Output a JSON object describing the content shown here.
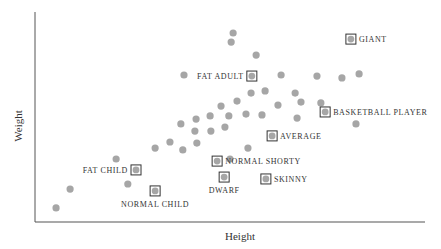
{
  "chart_data": {
    "type": "scatter",
    "title": "",
    "xlabel": "Height",
    "ylabel": "Weight",
    "grid": false,
    "legend": null,
    "xlim": [
      0,
      100
    ],
    "ylim": [
      0,
      100
    ],
    "axis_ticks": "none",
    "marker_color": "#a6a6a6",
    "box_color": "#333333",
    "series": [
      {
        "name": "population",
        "points": [
          {
            "x": 5.4,
            "y": 6.7
          },
          {
            "x": 9.0,
            "y": 15.7
          },
          {
            "x": 20.8,
            "y": 30.0
          },
          {
            "x": 23.8,
            "y": 18.1
          },
          {
            "x": 30.8,
            "y": 35.2
          },
          {
            "x": 34.6,
            "y": 38.1
          },
          {
            "x": 37.4,
            "y": 46.7
          },
          {
            "x": 38.2,
            "y": 70.0
          },
          {
            "x": 37.9,
            "y": 34.3
          },
          {
            "x": 41.3,
            "y": 49.0
          },
          {
            "x": 41.0,
            "y": 43.3
          },
          {
            "x": 41.5,
            "y": 37.6
          },
          {
            "x": 44.9,
            "y": 50.5
          },
          {
            "x": 45.1,
            "y": 43.3
          },
          {
            "x": 47.7,
            "y": 55.2
          },
          {
            "x": 48.7,
            "y": 45.2
          },
          {
            "x": 49.7,
            "y": 50.5
          },
          {
            "x": 50.0,
            "y": 30.0
          },
          {
            "x": 50.8,
            "y": 90.0
          },
          {
            "x": 50.3,
            "y": 85.7
          },
          {
            "x": 51.8,
            "y": 57.6
          },
          {
            "x": 54.1,
            "y": 51.4
          },
          {
            "x": 54.6,
            "y": 35.2
          },
          {
            "x": 55.4,
            "y": 61.4
          },
          {
            "x": 56.7,
            "y": 79.5
          },
          {
            "x": 58.2,
            "y": 51.0
          },
          {
            "x": 59.0,
            "y": 62.4
          },
          {
            "x": 62.3,
            "y": 55.7
          },
          {
            "x": 63.1,
            "y": 70.0
          },
          {
            "x": 66.7,
            "y": 61.4
          },
          {
            "x": 67.2,
            "y": 49.5
          },
          {
            "x": 68.2,
            "y": 57.1
          },
          {
            "x": 72.3,
            "y": 69.5
          },
          {
            "x": 73.3,
            "y": 56.7
          },
          {
            "x": 78.7,
            "y": 68.6
          },
          {
            "x": 82.3,
            "y": 46.7
          },
          {
            "x": 83.1,
            "y": 70.5
          }
        ]
      },
      {
        "name": "labelled",
        "points": [
          {
            "label": "GIANT",
            "x": 81.0,
            "y": 87.1
          },
          {
            "label": "FAT ADULT",
            "x": 55.6,
            "y": 69.5
          },
          {
            "label": "BASKETBALL PLAYER",
            "x": 74.4,
            "y": 52.4
          },
          {
            "label": "AVERAGE",
            "x": 60.8,
            "y": 41.0
          },
          {
            "label": "NORMAL SHORTY",
            "x": 46.7,
            "y": 29.0
          },
          {
            "label": "SKINNY",
            "x": 59.2,
            "y": 20.5
          },
          {
            "label": "FAT CHILD",
            "x": 25.9,
            "y": 24.8
          },
          {
            "label": "DWARF",
            "x": 48.5,
            "y": 21.4
          },
          {
            "label": "NORMAL CHILD",
            "x": 30.8,
            "y": 14.8
          }
        ]
      }
    ]
  },
  "plot_area": {
    "left": 35,
    "top": 12,
    "right": 425,
    "bottom": 222
  },
  "label_layout": {
    "GIANT": {
      "side": "right"
    },
    "FAT ADULT": {
      "side": "left"
    },
    "BASKETBALL PLAYER": {
      "side": "right"
    },
    "AVERAGE": {
      "side": "right"
    },
    "NORMAL SHORTY": {
      "side": "right"
    },
    "SKINNY": {
      "side": "right"
    },
    "FAT CHILD": {
      "side": "left"
    },
    "DWARF": {
      "side": "below"
    },
    "NORMAL CHILD": {
      "side": "below"
    }
  }
}
